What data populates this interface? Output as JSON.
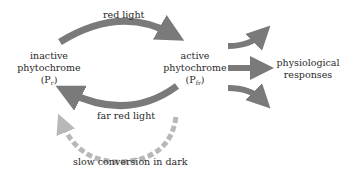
{
  "diagram": {
    "colors": {
      "arrow": "#7a7a7a",
      "dashed_arrow": "#b8b8b8",
      "text": "#2a2a2a"
    },
    "nodes": {
      "inactive": {
        "line1": "inactive",
        "line2": "phytochrome",
        "symbol": "P",
        "subscript": "r"
      },
      "active": {
        "line1": "active",
        "line2": "phytochrome",
        "symbol": "P",
        "subscript": "fr"
      },
      "responses": {
        "line1": "physiological",
        "line2": "responses"
      }
    },
    "edges": {
      "red_light": "red light",
      "far_red_light": "far red light",
      "dark": "slow conversion in dark"
    }
  }
}
